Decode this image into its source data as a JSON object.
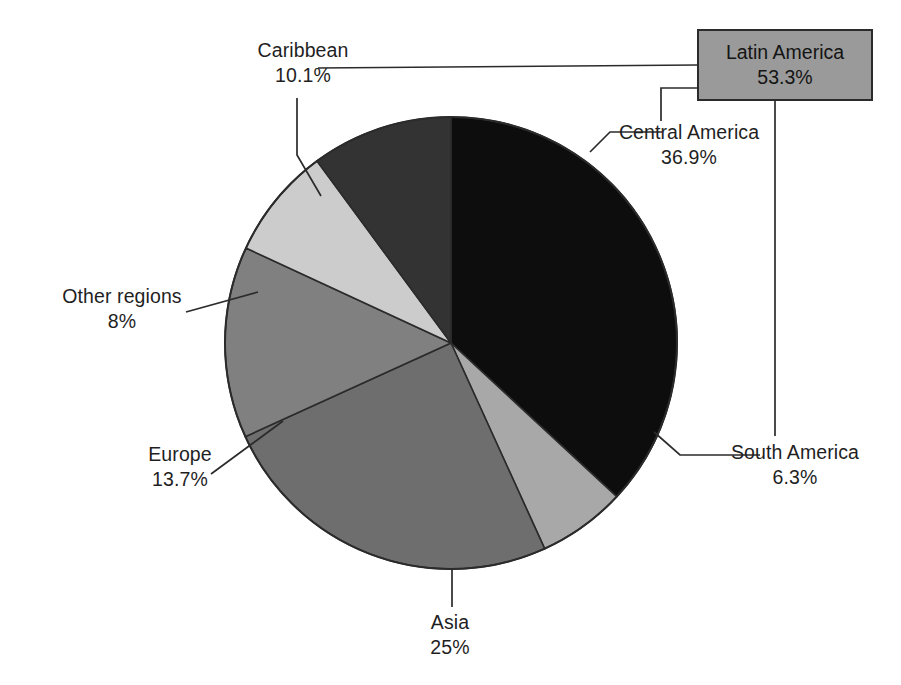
{
  "chart_data": {
    "type": "pie",
    "title": "",
    "xlabel": "",
    "ylabel": "",
    "legend_position": "none",
    "grid": false,
    "value_unit": "%",
    "categories": [
      "Central America",
      "South America",
      "Asia",
      "Europe",
      "Other regions",
      "Caribbean"
    ],
    "values": [
      36.9,
      6.3,
      25.0,
      13.7,
      8.0,
      10.1
    ],
    "slices": [
      {
        "label": "Central America",
        "value": 36.9,
        "display": "36.9%",
        "color": "#0d0d0d",
        "start_deg": 0.0,
        "end_deg": 132.84
      },
      {
        "label": "South America",
        "value": 6.3,
        "display": "6.3%",
        "color": "#a8a8a8",
        "start_deg": 132.84,
        "end_deg": 155.52
      },
      {
        "label": "Asia",
        "value": 25.0,
        "display": "25%",
        "color": "#6e6e6e",
        "start_deg": 155.52,
        "end_deg": 245.52
      },
      {
        "label": "Europe",
        "value": 13.7,
        "display": "13.7%",
        "color": "#808080",
        "start_deg": 245.52,
        "end_deg": 294.84
      },
      {
        "label": "Other regions",
        "value": 8.0,
        "display": "8%",
        "color": "#cccccc",
        "start_deg": 294.84,
        "end_deg": 323.64
      },
      {
        "label": "Caribbean",
        "value": 10.1,
        "display": "10.1%",
        "color": "#333333",
        "start_deg": 323.64,
        "end_deg": 360.0
      }
    ],
    "aggregate": {
      "label": "Latin America",
      "value": 53.3,
      "display": "53.3%",
      "components": [
        "Central America",
        "South America",
        "Caribbean"
      ],
      "color": "#9a9a9a"
    },
    "annotations": [
      "Latin America 53.3% groups Caribbean, Central America and South America"
    ]
  },
  "labels": {
    "caribbean": {
      "name": "Caribbean",
      "value": "10.1%"
    },
    "central": {
      "name": "Central America",
      "value": "36.9%"
    },
    "south": {
      "name": "South America",
      "value": "6.3%"
    },
    "asia": {
      "name": "Asia",
      "value": "25%"
    },
    "europe": {
      "name": "Europe",
      "value": "13.7%"
    },
    "other": {
      "name": "Other regions",
      "value": "8%"
    },
    "latin_america": {
      "name": "Latin America",
      "value": "53.3%"
    }
  },
  "colors": {
    "central_america": "#0d0d0d",
    "south_america": "#a8a8a8",
    "asia": "#6e6e6e",
    "europe": "#808080",
    "other_regions": "#cccccc",
    "caribbean": "#333333",
    "latin_america_box": "#9a9a9a",
    "outline": "#2b2b2b",
    "text": "#1f1f1f",
    "background": "#ffffff"
  }
}
